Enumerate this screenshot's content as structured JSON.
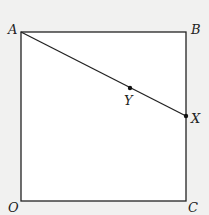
{
  "diagram": {
    "points": {
      "A": {
        "label": "A"
      },
      "B": {
        "label": "B"
      },
      "C": {
        "label": "C"
      },
      "O": {
        "label": "O"
      },
      "X": {
        "label": "X"
      },
      "Y": {
        "label": "Y"
      }
    },
    "shape": "square OABC",
    "segment": "AX",
    "colors": {
      "stroke": "#222222",
      "fill": "#ffffff",
      "background": "#f1f1f0"
    }
  }
}
